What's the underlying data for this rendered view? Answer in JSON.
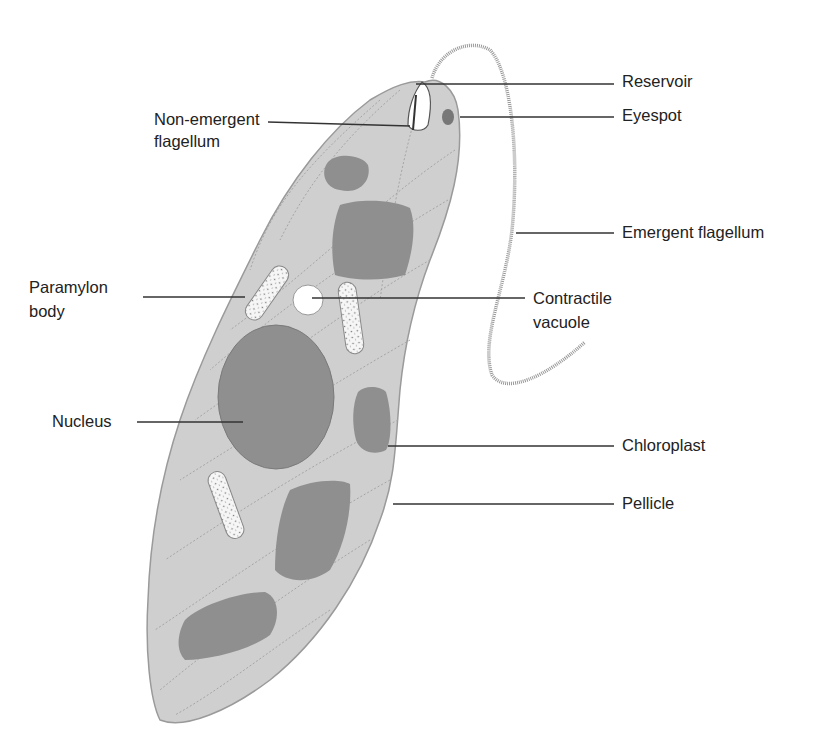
{
  "diagram": {
    "colors": {
      "cytoplasm": "#cfcfcf",
      "organelle": "#8f8f8f",
      "outline": "#9a9a9a",
      "leader": "#333333",
      "paramylon": "#f4f4f4"
    },
    "labels": {
      "reservoir": "Reservoir",
      "eyespot": "Eyespot",
      "non_emergent_1": "Non-emergent",
      "non_emergent_2": "flagellum",
      "emergent_flagellum": "Emergent flagellum",
      "paramylon_1": "Paramylon",
      "paramylon_2": "body",
      "contractile_1": "Contractile",
      "contractile_2": "vacuole",
      "nucleus": "Nucleus",
      "chloroplast": "Chloroplast",
      "pellicle": "Pellicle"
    }
  }
}
